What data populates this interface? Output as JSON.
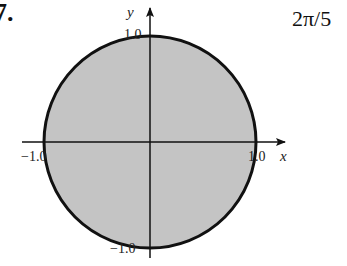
{
  "problem": {
    "number": "7.",
    "answer": "2π/5"
  },
  "figure": {
    "type": "filled-circle",
    "fill_color": "#c4c4c4",
    "stroke_color": "#111111",
    "radius": 1.0,
    "axes": {
      "x_label": "x",
      "y_label": "y"
    },
    "ticks": {
      "x_neg": "−1.0",
      "x_pos": "1.0",
      "y_pos": "1.0",
      "y_neg": "−1.0"
    }
  }
}
